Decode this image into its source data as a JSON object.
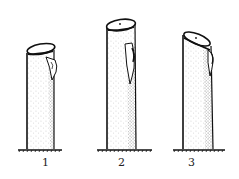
{
  "figure": {
    "items": [
      {
        "label": "1",
        "cut": "cut close above bud, slanted"
      },
      {
        "label": "2",
        "cut": "cut far above bud"
      },
      {
        "label": "3",
        "cut": "cut slanted, bud just below cut"
      }
    ],
    "colors": {
      "ink": "#111111",
      "background": "#ffffff",
      "stipple": "#555555"
    }
  }
}
